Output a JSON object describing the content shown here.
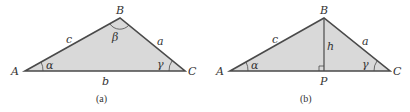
{
  "colors": {
    "fill": "#d9d9d9",
    "stroke": "#4a4a4a",
    "text": "#333333"
  },
  "figure_a": {
    "caption": "(a)",
    "vertices": {
      "A": "A",
      "B": "B",
      "C": "C"
    },
    "sides": {
      "a": "a",
      "b": "b",
      "c": "c"
    },
    "angles": {
      "alpha": "α",
      "beta": "β",
      "gamma": "γ"
    }
  },
  "figure_b": {
    "caption": "(b)",
    "vertices": {
      "A": "A",
      "B": "B",
      "C": "C",
      "P": "P"
    },
    "sides": {
      "a": "a",
      "c": "c",
      "h": "h"
    },
    "angles": {
      "alpha": "α",
      "gamma": "γ"
    }
  }
}
